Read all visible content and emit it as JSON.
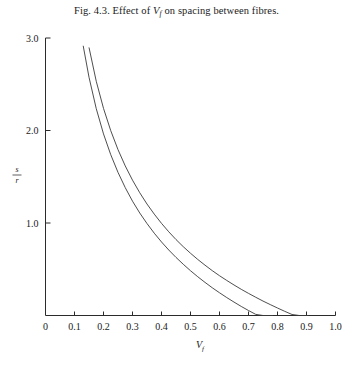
{
  "caption": {
    "prefix": "Fig. 4.3. Effect of ",
    "symbol": "V",
    "symbol_sub": "f",
    "suffix": " on spacing between fibres."
  },
  "axes": {
    "x": {
      "label": "V",
      "label_sub": "f",
      "ticks": [
        "0",
        "0.1",
        "0.2",
        "0.3",
        "0.4",
        "0.5",
        "0.6",
        "0.7",
        "0.8",
        "0.9",
        "1.0"
      ],
      "tick_values": [
        0,
        0.1,
        0.2,
        0.3,
        0.4,
        0.5,
        0.6,
        0.7,
        0.8,
        0.9,
        1.0
      ],
      "min": 0,
      "max": 1.0
    },
    "y": {
      "label_numerator": "s",
      "label_denominator": "r",
      "ticks": [
        "1.0",
        "2.0",
        "3.0"
      ],
      "tick_values": [
        1.0,
        2.0,
        3.0
      ],
      "min": 0,
      "max": 3.0
    }
  },
  "chart_data": {
    "type": "line",
    "title": "Fig. 4.3. Effect of Vf on spacing between fibres.",
    "xlabel": "Vf",
    "ylabel": "s/r",
    "xlim": [
      0,
      1.0
    ],
    "ylim": [
      0,
      3.0
    ],
    "grid": false,
    "legend": "none",
    "series": [
      {
        "name": "square packing",
        "color": "#3a3a3a",
        "zero_crossing": 0.785,
        "x": [
          0.13,
          0.15,
          0.175,
          0.2,
          0.225,
          0.25,
          0.275,
          0.3,
          0.325,
          0.35,
          0.375,
          0.4,
          0.425,
          0.45,
          0.475,
          0.5,
          0.525,
          0.55,
          0.575,
          0.6,
          0.625,
          0.65,
          0.675,
          0.7,
          0.725,
          0.75,
          0.785
        ],
        "y": [
          2.916,
          2.576,
          2.236,
          1.963,
          1.738,
          1.547,
          1.382,
          1.236,
          1.108,
          0.994,
          0.89,
          0.795,
          0.708,
          0.628,
          0.554,
          0.484,
          0.419,
          0.358,
          0.3,
          0.246,
          0.194,
          0.145,
          0.098,
          0.054,
          0.012,
          0.0,
          0.0
        ]
      },
      {
        "name": "hexagonal packing",
        "color": "#3a3a3a",
        "zero_crossing": 0.907,
        "x": [
          0.15,
          0.175,
          0.2,
          0.225,
          0.25,
          0.275,
          0.3,
          0.325,
          0.35,
          0.375,
          0.4,
          0.425,
          0.45,
          0.475,
          0.5,
          0.525,
          0.55,
          0.575,
          0.6,
          0.625,
          0.65,
          0.675,
          0.7,
          0.725,
          0.75,
          0.775,
          0.8,
          0.825,
          0.85,
          0.875,
          0.907
        ],
        "y": [
          2.898,
          2.532,
          2.239,
          1.998,
          1.793,
          1.617,
          1.463,
          1.327,
          1.205,
          1.096,
          0.996,
          0.905,
          0.821,
          0.744,
          0.673,
          0.606,
          0.544,
          0.485,
          0.43,
          0.379,
          0.33,
          0.283,
          0.239,
          0.197,
          0.156,
          0.118,
          0.081,
          0.045,
          0.011,
          0.0,
          0.0
        ]
      }
    ]
  }
}
